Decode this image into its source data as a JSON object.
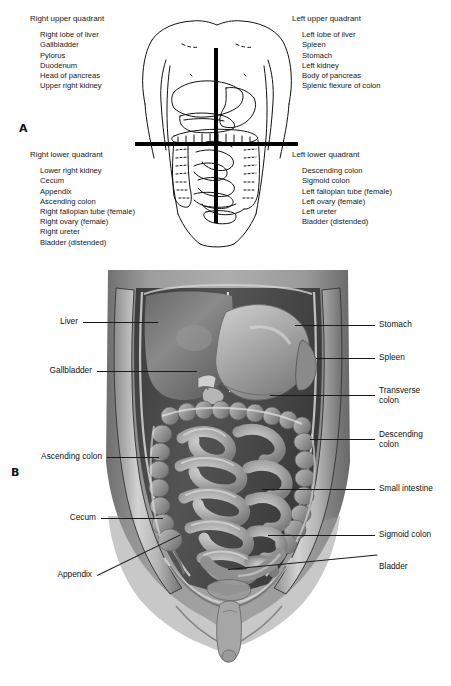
{
  "figure": {
    "panel_a_letter": "A",
    "panel_b_letter": "B"
  },
  "panel_a": {
    "quadrants": [
      {
        "id": "right-upper-quadrant",
        "title": "Right upper quadrant",
        "items": [
          "Right lobe of liver",
          "Gallbladder",
          "Pylorus",
          "Duodenum",
          "Head of pancreas",
          "Upper right kidney"
        ]
      },
      {
        "id": "left-upper-quadrant",
        "title": "Left upper quadrant",
        "items": [
          "Left lobe of liver",
          "Spleen",
          "Stomach",
          "Left kidney",
          "Body of pancreas",
          "Splenic flexure of colon"
        ]
      },
      {
        "id": "right-lower-quadrant",
        "title": "Right lower quadrant",
        "items": [
          "Lower right kidney",
          "Cecum",
          "Appendix",
          "Ascending colon",
          "Right fallopian tube (female)",
          "Right ovary (female)",
          "Right ureter",
          "Bladder (distended)"
        ]
      },
      {
        "id": "left-lower-quadrant",
        "title": "Left lower quadrant",
        "items": [
          "Descending colon",
          "Sigmoid colon",
          "Left fallopian tube (female)",
          "Left ovary (female)",
          "Left ureter",
          "Bladder (distended)"
        ]
      }
    ]
  },
  "panel_b": {
    "left_callouts": [
      {
        "id": "liver",
        "label": "Liver"
      },
      {
        "id": "gallbladder",
        "label": "Gallbladder"
      },
      {
        "id": "ascending-colon",
        "label": "Ascending colon"
      },
      {
        "id": "cecum",
        "label": "Cecum"
      },
      {
        "id": "appendix",
        "label": "Appendix"
      }
    ],
    "right_callouts": [
      {
        "id": "stomach",
        "label": "Stomach"
      },
      {
        "id": "spleen",
        "label": "Spleen"
      },
      {
        "id": "transverse-colon",
        "label": "Transverse\ncolon"
      },
      {
        "id": "descending-colon",
        "label": "Descending\ncolon"
      },
      {
        "id": "small-intestine",
        "label": "Small intestine"
      },
      {
        "id": "sigmoid-colon",
        "label": "Sigmoid colon"
      },
      {
        "id": "bladder",
        "label": "Bladder"
      }
    ]
  },
  "colors": {
    "background": "#ffffff",
    "ink": "#000000",
    "leader_line": "#1a1a1a",
    "cavity_dark": "#4a4a4a",
    "organ_mid": "#8e8e8e",
    "organ_light": "#c9c9c9",
    "skin_mid": "#9a9a9a",
    "skin_dark": "#6d6d6d"
  }
}
